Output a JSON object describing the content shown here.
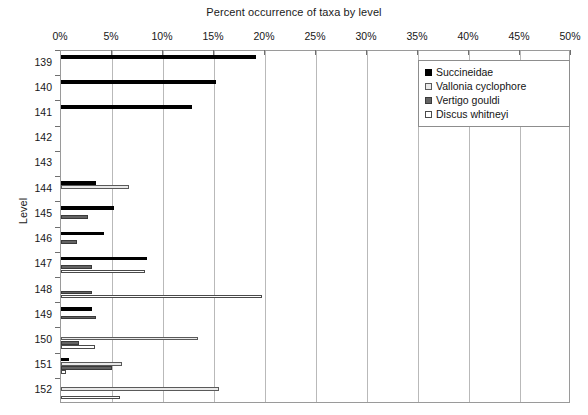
{
  "chart_data": {
    "type": "bar",
    "orientation": "horizontal",
    "title": "Percent occurrence of taxa by level",
    "xlabel": "",
    "ylabel": "Level",
    "xlim": [
      0,
      50
    ],
    "xunit": "%",
    "grid": true,
    "legend_position": "top-right",
    "xticks": [
      "0%",
      "5%",
      "10%",
      "15%",
      "20%",
      "25%",
      "30%",
      "35%",
      "40%",
      "45%",
      "50%"
    ],
    "xtick_values": [
      0,
      5,
      10,
      15,
      20,
      25,
      30,
      35,
      40,
      45,
      50
    ],
    "categories": [
      "139",
      "140",
      "141",
      "142",
      "143",
      "144",
      "145",
      "146",
      "147",
      "148",
      "149",
      "150",
      "151",
      "152"
    ],
    "series": [
      {
        "name": "Succineidae",
        "color": "#000000",
        "values": [
          19.1,
          15.2,
          12.8,
          0,
          0,
          3.4,
          5.2,
          4.2,
          8.4,
          0,
          3.0,
          0,
          0.8,
          0
        ]
      },
      {
        "name": "Vallonia cyclophore",
        "color": "#e9e9e9",
        "values": [
          0,
          0,
          0,
          0,
          0,
          6.7,
          0,
          0,
          0,
          0,
          0,
          13.4,
          6.0,
          15.5
        ]
      },
      {
        "name": "Vertigo gouldi",
        "color": "#636363",
        "values": [
          0,
          0,
          0,
          0,
          0,
          0,
          2.6,
          1.6,
          3.0,
          3.0,
          3.4,
          1.8,
          5.0,
          0
        ]
      },
      {
        "name": "Discus whitneyi",
        "color": "#ffffff",
        "values": [
          0,
          0,
          0,
          0,
          0,
          0,
          0,
          0,
          8.2,
          19.7,
          0,
          3.3,
          0.5,
          5.8
        ]
      }
    ]
  },
  "legend": {
    "items": [
      {
        "label": "Succineidae"
      },
      {
        "label": "Vallonia cyclophore"
      },
      {
        "label": "Vertigo gouldi"
      },
      {
        "label": "Discus whitneyi"
      }
    ]
  }
}
